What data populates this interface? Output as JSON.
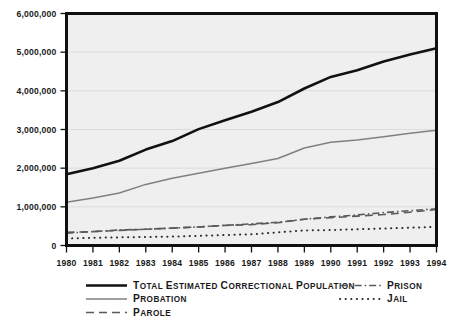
{
  "chart_data": {
    "type": "line",
    "title": "",
    "xlabel": "",
    "ylabel": "",
    "x": [
      1980,
      1981,
      1982,
      1983,
      1984,
      1985,
      1986,
      1987,
      1988,
      1989,
      1990,
      1991,
      1992,
      1993,
      1994
    ],
    "xtick_labels": [
      "1980",
      "1981",
      "1982",
      "1983",
      "1984",
      "1985",
      "1986",
      "1987",
      "1988",
      "1989",
      "1990",
      "1991",
      "1992",
      "1993",
      "1994"
    ],
    "ytick_labels": [
      "0",
      "1,000,000",
      "2,000,000",
      "3,000,000",
      "4,000,000",
      "5,000,000",
      "6,000,000"
    ],
    "ytick_values": [
      0,
      1000000,
      2000000,
      3000000,
      4000000,
      5000000,
      6000000
    ],
    "ylim": [
      0,
      6000000
    ],
    "xlim": [
      1980,
      1994
    ],
    "grid": true,
    "legend_position": "below-plot",
    "series": [
      {
        "name": "Total estimated correctional population",
        "style": "solid-thick",
        "color": "#111111",
        "values": [
          1840000,
          2000000,
          2190000,
          2480000,
          2700000,
          3010000,
          3240000,
          3460000,
          3710000,
          4060000,
          4360000,
          4530000,
          4760000,
          4940000,
          5100000
        ]
      },
      {
        "name": "Probation",
        "style": "solid-thin",
        "color": "#808080",
        "values": [
          1120000,
          1230000,
          1360000,
          1580000,
          1740000,
          1870000,
          2000000,
          2120000,
          2250000,
          2520000,
          2670000,
          2730000,
          2810000,
          2900000,
          2980000
        ]
      },
      {
        "name": "Parole",
        "style": "dashed",
        "color": "#5a5a5a",
        "values": [
          340000,
          360000,
          390000,
          420000,
          450000,
          480000,
          520000,
          540000,
          590000,
          680000,
          720000,
          760000,
          800000,
          860000,
          930000
        ]
      },
      {
        "name": "Prison",
        "style": "dash-dot",
        "color": "#5a5a5a",
        "values": [
          320000,
          360000,
          400000,
          420000,
          450000,
          480000,
          520000,
          560000,
          600000,
          680000,
          740000,
          790000,
          850000,
          900000,
          950000
        ]
      },
      {
        "name": "Jail",
        "style": "dotted",
        "color": "#2b2b2b",
        "values": [
          180000,
          200000,
          210000,
          220000,
          230000,
          250000,
          270000,
          290000,
          340000,
          390000,
          400000,
          420000,
          440000,
          460000,
          480000
        ]
      }
    ]
  },
  "legend": {
    "items": [
      {
        "label": "Total estimated correctional population",
        "swatch": "solid-thick",
        "column": "left"
      },
      {
        "label": "Probation",
        "swatch": "solid-thin",
        "column": "left"
      },
      {
        "label": "Parole",
        "swatch": "dashed",
        "column": "left"
      },
      {
        "label": "Prison",
        "swatch": "dash-dot",
        "column": "right"
      },
      {
        "label": "Jail",
        "swatch": "dotted",
        "column": "right"
      }
    ]
  },
  "colors": {
    "page_background": "#ffffff",
    "plot_background": "#efefef",
    "frame": "#101010",
    "gridline": "#dcdcdc",
    "total_line": "#111111",
    "probation_line": "#808080",
    "parole_line": "#5a5a5a",
    "prison_line": "#5a5a5a",
    "jail_line": "#2b2b2b"
  }
}
